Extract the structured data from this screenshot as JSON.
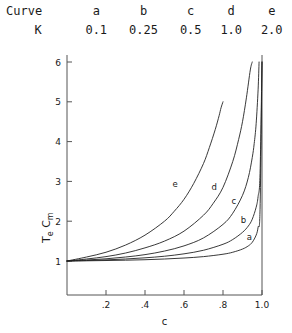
{
  "legend": {
    "row_labels": [
      "Curve",
      "K"
    ],
    "curves": [
      "a",
      "b",
      "c",
      "d",
      "e"
    ],
    "k_values": [
      "0.1",
      "0.25",
      "0.5",
      "1.0",
      "2.0"
    ]
  },
  "axis": {
    "y_label_main": "T",
    "y_label_sub1": "e",
    "y_label_main2": "C",
    "y_label_sub2": "m",
    "y_ticks": [
      "1",
      "2",
      "3",
      "4",
      "5",
      "6"
    ],
    "x_ticks": [
      ".2",
      ".4",
      ".6",
      ".8",
      "1.0"
    ],
    "x_label": "c"
  },
  "curve_labels": {
    "a": "a",
    "b": "b",
    "c": "c",
    "d": "d",
    "e": "e"
  },
  "colors": {
    "ink": "#1a1a1a",
    "axis": "#555555",
    "curve": "#222222",
    "background": "#ffffff"
  },
  "chart_data": {
    "type": "line",
    "title": "",
    "xlabel": "c",
    "ylabel": "Te Cm",
    "xlim": [
      0,
      1.0
    ],
    "ylim": [
      0.6,
      6.2
    ],
    "x_ticks": [
      0.2,
      0.4,
      0.6,
      0.8,
      1.0
    ],
    "y_ticks": [
      1,
      2,
      3,
      4,
      5,
      6
    ],
    "grid": false,
    "legend_position": "top-table",
    "legend_entries": [
      {
        "curve": "a",
        "K": 0.1
      },
      {
        "curve": "b",
        "K": 0.25
      },
      {
        "curve": "c",
        "K": 0.5
      },
      {
        "curve": "d",
        "K": 1.0
      },
      {
        "curve": "e",
        "K": 2.0
      }
    ],
    "series": [
      {
        "name": "a",
        "K": 0.1,
        "x": [
          0.0,
          0.1,
          0.2,
          0.3,
          0.4,
          0.5,
          0.6,
          0.7,
          0.8,
          0.85,
          0.9,
          0.93,
          0.95,
          0.97,
          0.98,
          0.99,
          1.0
        ],
        "values": [
          1.0,
          1.005,
          1.012,
          1.02,
          1.032,
          1.05,
          1.075,
          1.11,
          1.17,
          1.22,
          1.3,
          1.38,
          1.47,
          1.65,
          1.85,
          2.3,
          6.0
        ]
      },
      {
        "name": "b",
        "K": 0.25,
        "x": [
          0.0,
          0.1,
          0.2,
          0.3,
          0.4,
          0.5,
          0.6,
          0.7,
          0.8,
          0.85,
          0.9,
          0.93,
          0.95,
          0.97,
          0.98,
          0.99,
          1.0
        ],
        "values": [
          1.0,
          1.012,
          1.028,
          1.05,
          1.08,
          1.12,
          1.18,
          1.27,
          1.42,
          1.54,
          1.72,
          1.88,
          2.05,
          2.35,
          2.62,
          3.2,
          6.0
        ]
      },
      {
        "name": "c",
        "K": 0.5,
        "x": [
          0.0,
          0.1,
          0.2,
          0.3,
          0.4,
          0.5,
          0.6,
          0.7,
          0.8,
          0.85,
          0.9,
          0.93,
          0.95,
          0.96,
          0.97,
          0.98,
          0.985
        ],
        "values": [
          1.0,
          1.025,
          1.055,
          1.1,
          1.16,
          1.25,
          1.38,
          1.58,
          1.92,
          2.2,
          2.65,
          3.1,
          3.6,
          3.95,
          4.45,
          5.3,
          6.0
        ]
      },
      {
        "name": "d",
        "K": 1.0,
        "x": [
          0.0,
          0.1,
          0.2,
          0.3,
          0.4,
          0.5,
          0.6,
          0.7,
          0.75,
          0.8,
          0.85,
          0.88,
          0.9,
          0.92,
          0.94,
          0.95
        ],
        "values": [
          1.0,
          1.05,
          1.11,
          1.2,
          1.33,
          1.5,
          1.75,
          2.15,
          2.45,
          2.85,
          3.5,
          4.05,
          4.5,
          5.1,
          5.8,
          6.0
        ]
      },
      {
        "name": "e",
        "K": 2.0,
        "x": [
          0.0,
          0.1,
          0.2,
          0.3,
          0.4,
          0.5,
          0.55,
          0.6,
          0.65,
          0.7,
          0.73,
          0.76,
          0.78,
          0.79,
          0.8
        ],
        "values": [
          1.0,
          1.1,
          1.22,
          1.4,
          1.65,
          2.0,
          2.25,
          2.55,
          2.95,
          3.45,
          3.85,
          4.3,
          4.65,
          4.85,
          5.0
        ]
      }
    ],
    "annotations": [
      {
        "text": "a",
        "x": 0.935,
        "y": 1.52
      },
      {
        "text": "b",
        "x": 0.905,
        "y": 1.95
      },
      {
        "text": "c",
        "x": 0.855,
        "y": 2.42
      },
      {
        "text": "d",
        "x": 0.755,
        "y": 2.78
      },
      {
        "text": "e",
        "x": 0.555,
        "y": 2.85
      }
    ]
  }
}
